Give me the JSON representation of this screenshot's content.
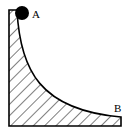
{
  "diagram": {
    "labels": {
      "start": "A",
      "end": "B"
    },
    "colors": {
      "stroke": "#000000",
      "fill": "#ffffff",
      "ball": "#000000"
    },
    "elements": [
      "hatched-ramp-block",
      "ball-at-A",
      "curved-surface-A-to-B"
    ]
  }
}
